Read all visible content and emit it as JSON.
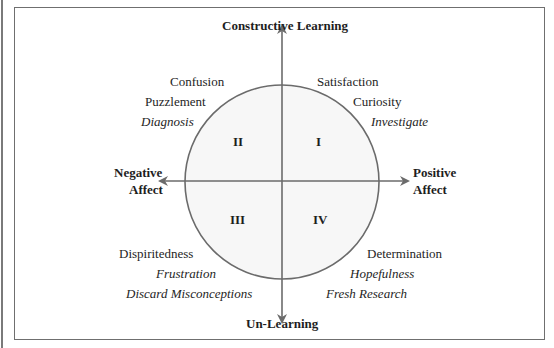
{
  "axes": {
    "top": "Constructive Learning",
    "bottom": "Un-Learning",
    "left_line1": "Negative",
    "left_line2": "Affect",
    "right_line1": "Positive",
    "right_line2": "Affect"
  },
  "quadrants": {
    "I": {
      "numeral": "I",
      "terms": [
        "Satisfaction",
        "Curiosity"
      ],
      "action": "Investigate"
    },
    "II": {
      "numeral": "II",
      "terms": [
        "Confusion",
        "Puzzlement"
      ],
      "action": "Diagnosis"
    },
    "III": {
      "numeral": "III",
      "terms": [
        "Dispiritedness"
      ],
      "italic_terms": [
        "Frustration"
      ],
      "action": "Discard Misconceptions"
    },
    "IV": {
      "numeral": "IV",
      "terms": [
        "Determination"
      ],
      "italic_terms": [
        "Hopefulness"
      ],
      "action": "Fresh Research"
    }
  },
  "colors": {
    "line": "#6b6b6b",
    "circle_fill": "#f7f7f7",
    "text": "#1e1e1e"
  }
}
